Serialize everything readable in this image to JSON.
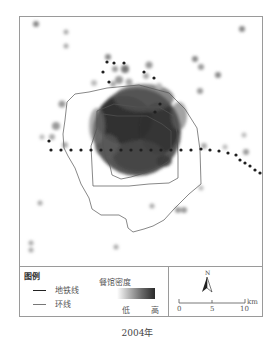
{
  "map": {
    "type": "kernel density map",
    "subject": "restaurant density",
    "features": {
      "subway_lines": "dotted dark lines (east-west line through center, northern branch, southeast extension)",
      "ring_roads": [
        "inner ring (2nd ring)",
        "middle ring (3rd ring)",
        "outer ring (4th/5th ring)"
      ],
      "density_hotspots": "dense dark cluster in central area within inner rings, scattered light points outside"
    }
  },
  "legend": {
    "title": "图例",
    "items": [
      {
        "symbol": "thick-dark-line",
        "label": "地铁线"
      },
      {
        "symbol": "thin-gray-line",
        "label": "环线"
      }
    ],
    "density": {
      "title": "餐馆密度",
      "low_label": "低",
      "high_label": "高",
      "colors": [
        "#ffffff",
        "#2a2a2a"
      ]
    }
  },
  "north_arrow": {
    "label": "N"
  },
  "scale_bar": {
    "ticks": [
      "0",
      "5",
      "10"
    ],
    "unit": "km"
  },
  "caption": "2004年"
}
